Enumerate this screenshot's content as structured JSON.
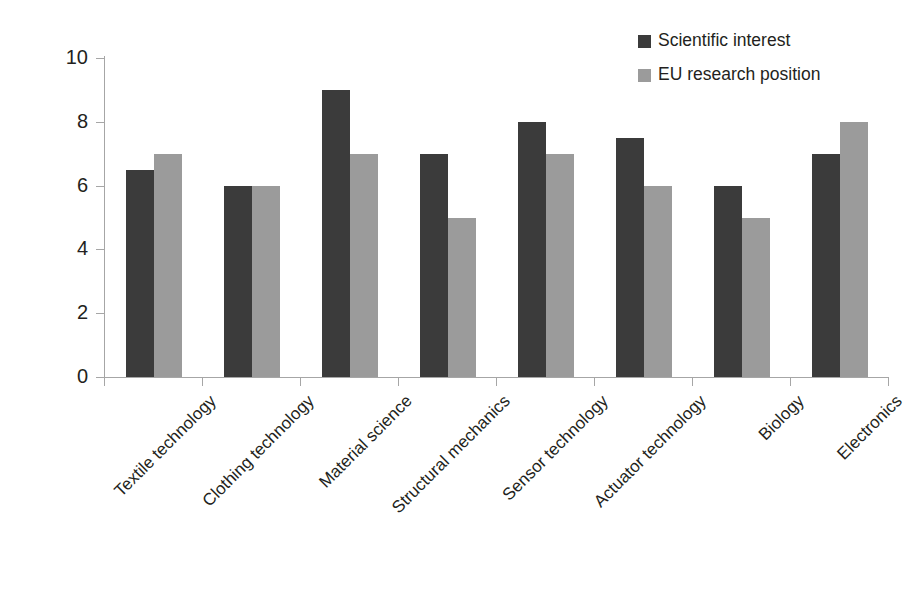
{
  "chart_data": {
    "type": "bar",
    "title": "",
    "xlabel": "",
    "ylabel": "",
    "ylim": [
      0,
      10
    ],
    "yticks": [
      0,
      2,
      4,
      6,
      8,
      10
    ],
    "grid": false,
    "legend_position": "top-right",
    "categories": [
      "Textile technology",
      "Clothing technology",
      "Material science",
      "Structural mechanics",
      "Sensor technology",
      "Actuator technology",
      "Biology",
      "Electronics"
    ],
    "series": [
      {
        "name": "Scientific interest",
        "color": "#3b3b3b",
        "values": [
          6.5,
          6.0,
          9.0,
          7.0,
          8.0,
          7.5,
          6.0,
          7.0
        ]
      },
      {
        "name": "EU research position",
        "color": "#9b9b9b",
        "values": [
          7.0,
          6.0,
          7.0,
          5.0,
          7.0,
          6.0,
          5.0,
          8.0
        ]
      }
    ]
  },
  "axis": {
    "line_color": "#a6a6a6",
    "tick_labels": [
      "0",
      "2",
      "4",
      "6",
      "8",
      "10"
    ]
  }
}
